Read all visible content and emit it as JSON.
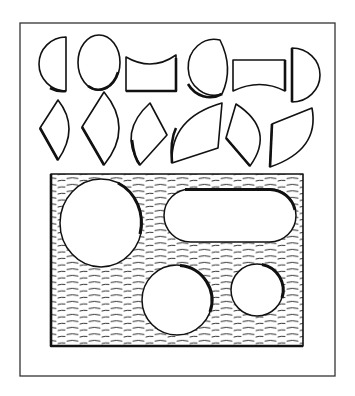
{
  "figure": {
    "title": "Shape puzzle pieces and form board with holes",
    "frame": {
      "x": 20,
      "y": 23,
      "w": 315,
      "h": 353,
      "stroke": "#333333"
    },
    "ink_color": "#111111",
    "background": "#ffffff",
    "pieces_row1": [
      {
        "name": "half-circle-left",
        "hatch": "horizontal"
      },
      {
        "name": "circle",
        "hatch": "diagonal"
      },
      {
        "name": "concave-top-block",
        "hatch": "vertical"
      },
      {
        "name": "truncated-circle",
        "hatch": "horizontal"
      },
      {
        "name": "concave-bottom-block",
        "hatch": "vertical"
      },
      {
        "name": "half-circle-right",
        "hatch": "horizontal"
      }
    ],
    "pieces_row2": [
      {
        "name": "small-kite-arc",
        "hatch": "horizontal"
      },
      {
        "name": "large-kite-arc",
        "hatch": "horizontal"
      },
      {
        "name": "tilted-arc-quad",
        "hatch": "diagonal"
      },
      {
        "name": "quarter-segment",
        "hatch": "vertical"
      },
      {
        "name": "tilted-kite-arc",
        "hatch": "diagonal"
      },
      {
        "name": "slanted-arc-quad",
        "hatch": "horizontal"
      }
    ],
    "board": {
      "x": 51,
      "y": 174,
      "w": 252,
      "h": 172,
      "holes": [
        {
          "name": "large-circle-hole",
          "cx": 101,
          "cy": 223,
          "rx": 41,
          "ry": 44
        },
        {
          "name": "stadium-hole",
          "x": 164,
          "y": 189,
          "w": 132,
          "h": 53
        },
        {
          "name": "medium-circle-hole",
          "cx": 177,
          "cy": 300,
          "r": 35
        },
        {
          "name": "small-circle-hole",
          "cx": 257,
          "cy": 290,
          "r": 26
        }
      ]
    }
  }
}
